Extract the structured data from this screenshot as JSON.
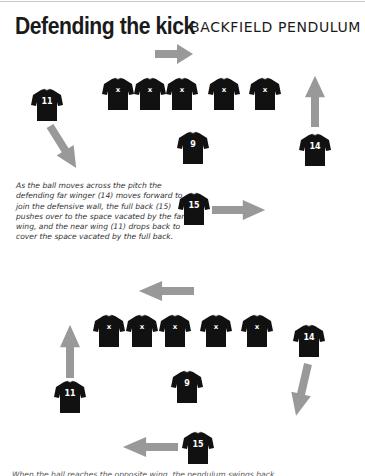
{
  "header": {
    "title": "Defending the kick",
    "subtitle": "BACKFIELD PENDULUM"
  },
  "caption": "As the ball moves across the pitch the defending far winger (14) moves forward to join the defensive wall, the full back (15) pushes over to the space vacated by the far wing, and the near wing (11) drops back to cover the space vacated by the full back.",
  "footer_text": "When the ball reaches the opposite wing, the pendulum swings back...",
  "colors": {
    "shirt": "#111111",
    "arrow": "#999999",
    "text": "#1a1a1a"
  },
  "diagram_top": {
    "wall_players": [
      {
        "label": "x",
        "x": 101,
        "y": 77
      },
      {
        "label": "x",
        "x": 133,
        "y": 77
      },
      {
        "label": "x",
        "x": 165,
        "y": 77
      },
      {
        "label": "x",
        "x": 207,
        "y": 77
      },
      {
        "label": "x",
        "x": 248,
        "y": 77
      }
    ],
    "players": [
      {
        "label": "11",
        "x": 30,
        "y": 88
      },
      {
        "label": "9",
        "x": 176,
        "y": 131
      },
      {
        "label": "14",
        "x": 298,
        "y": 133
      },
      {
        "label": "15",
        "x": 177,
        "y": 192
      }
    ]
  },
  "diagram_bottom": {
    "wall_players": [
      {
        "label": "x",
        "x": 92,
        "y": 314
      },
      {
        "label": "x",
        "x": 125,
        "y": 314
      },
      {
        "label": "x",
        "x": 158,
        "y": 314
      },
      {
        "label": "x",
        "x": 199,
        "y": 314
      },
      {
        "label": "x",
        "x": 240,
        "y": 314
      }
    ],
    "players": [
      {
        "label": "14",
        "x": 292,
        "y": 324
      },
      {
        "label": "9",
        "x": 170,
        "y": 370
      },
      {
        "label": "11",
        "x": 53,
        "y": 380
      },
      {
        "label": "15",
        "x": 181,
        "y": 431
      }
    ]
  }
}
